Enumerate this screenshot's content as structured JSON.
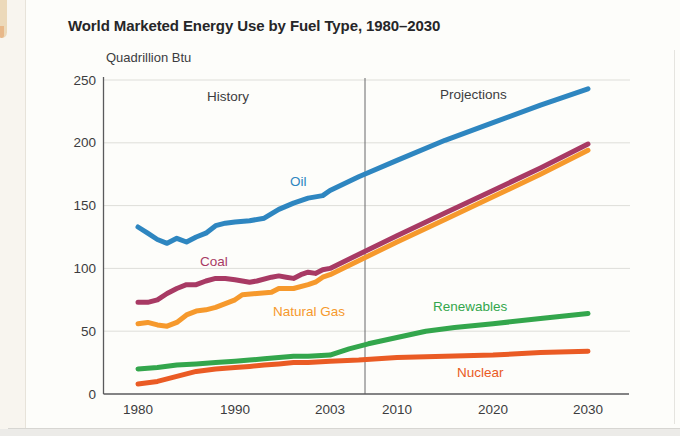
{
  "chart_data": {
    "type": "line",
    "title": "World Marketed Energy Use by Fuel Type, 1980–2030",
    "ylabel": "Quadrillion Btu",
    "xlabel": "",
    "x_ticks": [
      "1980",
      "1990",
      "2003",
      "2010",
      "2020",
      "2030"
    ],
    "y_ticks": [
      0,
      50,
      100,
      150,
      200,
      250
    ],
    "ylim": [
      0,
      250
    ],
    "grid": "horizontal light-gray lines at each 50 Quadrillion Btu",
    "legend_position": "inline labels next to each line",
    "annotations": {
      "history": "History",
      "projections": "Projections",
      "divider_note": "vertical line separates history from projections (between 2003 and 2010)"
    },
    "colors": {
      "oil": "#2e86c0",
      "coal": "#a83a64",
      "natural_gas": "#f6992c",
      "renewables": "#33a64c",
      "nuclear": "#ea5b24",
      "axis": "#5a5a5c",
      "gridline": "#deded9",
      "text": "#3c3c3e"
    },
    "series": [
      {
        "name": "Oil",
        "color": "#2e86c0",
        "points": [
          [
            1980,
            133
          ],
          [
            1981,
            128
          ],
          [
            1982,
            123
          ],
          [
            1983,
            120
          ],
          [
            1984,
            124
          ],
          [
            1985,
            121
          ],
          [
            1986,
            125
          ],
          [
            1987,
            128
          ],
          [
            1988,
            134
          ],
          [
            1989,
            136
          ],
          [
            1990,
            137
          ],
          [
            1992,
            138
          ],
          [
            1994,
            140
          ],
          [
            1996,
            147
          ],
          [
            1998,
            152
          ],
          [
            2000,
            156
          ],
          [
            2002,
            158
          ],
          [
            2003,
            162
          ],
          [
            2006,
            173
          ],
          [
            2010,
            186
          ],
          [
            2015,
            202
          ],
          [
            2020,
            216
          ],
          [
            2025,
            230
          ],
          [
            2030,
            243
          ]
        ]
      },
      {
        "name": "Coal",
        "color": "#a83a64",
        "points": [
          [
            1980,
            73
          ],
          [
            1981,
            73
          ],
          [
            1982,
            75
          ],
          [
            1983,
            80
          ],
          [
            1984,
            84
          ],
          [
            1985,
            87
          ],
          [
            1986,
            87
          ],
          [
            1987,
            90
          ],
          [
            1988,
            92
          ],
          [
            1989,
            92
          ],
          [
            1990,
            91
          ],
          [
            1991,
            90
          ],
          [
            1992,
            89
          ],
          [
            1993,
            90
          ],
          [
            1995,
            93
          ],
          [
            1996,
            94
          ],
          [
            1997,
            93
          ],
          [
            1998,
            92
          ],
          [
            1999,
            95
          ],
          [
            2000,
            97
          ],
          [
            2001,
            96
          ],
          [
            2002,
            99
          ],
          [
            2003,
            100
          ],
          [
            2010,
            126
          ],
          [
            2015,
            144
          ],
          [
            2020,
            162
          ],
          [
            2025,
            180
          ],
          [
            2030,
            199
          ]
        ]
      },
      {
        "name": "Natural Gas",
        "color": "#f6992c",
        "points": [
          [
            1980,
            56
          ],
          [
            1981,
            57
          ],
          [
            1982,
            55
          ],
          [
            1983,
            54
          ],
          [
            1984,
            57
          ],
          [
            1985,
            63
          ],
          [
            1986,
            66
          ],
          [
            1987,
            67
          ],
          [
            1988,
            69
          ],
          [
            1989,
            72
          ],
          [
            1990,
            75
          ],
          [
            1991,
            79
          ],
          [
            1993,
            80
          ],
          [
            1995,
            81
          ],
          [
            1996,
            84
          ],
          [
            1998,
            84
          ],
          [
            2000,
            87
          ],
          [
            2001,
            89
          ],
          [
            2002,
            93
          ],
          [
            2003,
            95
          ],
          [
            2010,
            121
          ],
          [
            2015,
            139
          ],
          [
            2020,
            157
          ],
          [
            2025,
            175
          ],
          [
            2030,
            194
          ]
        ]
      },
      {
        "name": "Renewables",
        "color": "#33a64c",
        "points": [
          [
            1980,
            20
          ],
          [
            1982,
            21
          ],
          [
            1984,
            23
          ],
          [
            1986,
            24
          ],
          [
            1988,
            25
          ],
          [
            1990,
            26
          ],
          [
            1992,
            27
          ],
          [
            1994,
            28
          ],
          [
            1996,
            29
          ],
          [
            1998,
            30
          ],
          [
            2000,
            30
          ],
          [
            2003,
            31
          ],
          [
            2005,
            36
          ],
          [
            2007,
            40
          ],
          [
            2010,
            45
          ],
          [
            2013,
            50
          ],
          [
            2016,
            53
          ],
          [
            2020,
            56
          ],
          [
            2025,
            60
          ],
          [
            2030,
            64
          ]
        ]
      },
      {
        "name": "Nuclear",
        "color": "#ea5b24",
        "points": [
          [
            1980,
            8
          ],
          [
            1982,
            10
          ],
          [
            1984,
            14
          ],
          [
            1986,
            18
          ],
          [
            1988,
            20
          ],
          [
            1990,
            21
          ],
          [
            1992,
            22
          ],
          [
            1994,
            23
          ],
          [
            1996,
            24
          ],
          [
            1998,
            25
          ],
          [
            2000,
            25
          ],
          [
            2003,
            26
          ],
          [
            2006,
            27
          ],
          [
            2010,
            29
          ],
          [
            2015,
            30
          ],
          [
            2020,
            31
          ],
          [
            2025,
            33
          ],
          [
            2030,
            34
          ]
        ]
      }
    ]
  }
}
